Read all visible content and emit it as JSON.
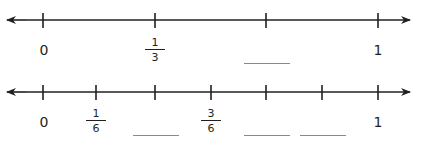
{
  "number_lines": [
    {
      "id": "thirds",
      "labels": {
        "zero": "0",
        "one": "1"
      },
      "fractions": [
        {
          "num": "1",
          "den": "3"
        }
      ],
      "blanks": 1
    },
    {
      "id": "sixths",
      "labels": {
        "zero": "0",
        "one": "1"
      },
      "fractions": [
        {
          "num": "1",
          "den": "6"
        },
        {
          "num": "3",
          "den": "6"
        }
      ],
      "blanks": 3
    }
  ],
  "colors": {
    "line": "#231f20",
    "blank": "#8a8a8a"
  }
}
